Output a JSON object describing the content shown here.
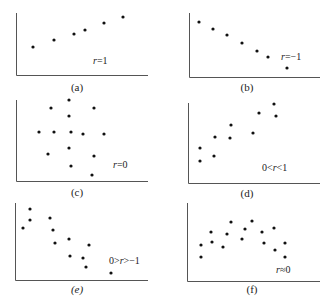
{
  "chart_data": [
    {
      "type": "scatter",
      "panel": "a",
      "caption": "(a)",
      "annotation": "r=1",
      "axes": {
        "origin": [
          16,
          75
        ],
        "x_end": 148,
        "y_top": 13
      },
      "points": [
        [
          33,
          47
        ],
        [
          54,
          40
        ],
        [
          74,
          34
        ],
        [
          85,
          30
        ],
        [
          104,
          23
        ],
        [
          123,
          17
        ]
      ],
      "label_pos": [
        93,
        64
      ],
      "caption_pos": [
        77,
        91
      ],
      "xlabel": "",
      "ylabel": "",
      "grid": false
    },
    {
      "type": "scatter",
      "panel": "b",
      "caption": "(b)",
      "annotation": "r=−1",
      "axes": {
        "origin": [
          189,
          77
        ],
        "x_end": 320,
        "y_top": 13
      },
      "points": [
        [
          199,
          22
        ],
        [
          213,
          29
        ],
        [
          227,
          35
        ],
        [
          242,
          43
        ],
        [
          257,
          51
        ],
        [
          268,
          57
        ],
        [
          287,
          68
        ]
      ],
      "label_pos": [
        281,
        60
      ],
      "caption_pos": [
        247,
        91
      ],
      "xlabel": "",
      "ylabel": "",
      "grid": false
    },
    {
      "type": "scatter",
      "panel": "c",
      "caption": "(c)",
      "annotation": "r=0",
      "axes": {
        "origin": [
          16,
          181
        ],
        "x_end": 148,
        "y_top": 100
      },
      "points": [
        [
          51,
          108
        ],
        [
          69,
          100
        ],
        [
          94,
          108
        ],
        [
          69,
          116
        ],
        [
          39,
          132
        ],
        [
          54,
          132
        ],
        [
          71,
          132
        ],
        [
          83,
          134
        ],
        [
          104,
          134
        ],
        [
          69,
          148
        ],
        [
          48,
          154
        ],
        [
          94,
          156
        ],
        [
          71,
          166
        ],
        [
          92,
          175
        ]
      ],
      "label_pos": [
        113,
        168
      ],
      "caption_pos": [
        77,
        196
      ],
      "xlabel": "",
      "ylabel": "",
      "grid": false
    },
    {
      "type": "scatter",
      "panel": "d",
      "caption": "(d)",
      "annotation": "0<r<1",
      "axes": {
        "origin": [
          188,
          183
        ],
        "x_end": 320,
        "y_top": 103
      },
      "points": [
        [
          200,
          148
        ],
        [
          200,
          161
        ],
        [
          215,
          137
        ],
        [
          214,
          156
        ],
        [
          230,
          138
        ],
        [
          231,
          125
        ],
        [
          253,
          133
        ],
        [
          259,
          113
        ],
        [
          274,
          104
        ],
        [
          276,
          116
        ]
      ],
      "label_pos": [
        262,
        171
      ],
      "caption_pos": [
        247,
        197
      ],
      "xlabel": "",
      "ylabel": "",
      "grid": false
    },
    {
      "type": "scatter",
      "panel": "e",
      "caption": "(e)",
      "annotation": "0>r>−1",
      "axes": {
        "origin": [
          15,
          280
        ],
        "x_end": 148,
        "y_top": 203
      },
      "points": [
        [
          30,
          209
        ],
        [
          30,
          220
        ],
        [
          23,
          228
        ],
        [
          50,
          218
        ],
        [
          53,
          230
        ],
        [
          55,
          243
        ],
        [
          69,
          239
        ],
        [
          70,
          256
        ],
        [
          89,
          245
        ],
        [
          83,
          258
        ],
        [
          86,
          267
        ],
        [
          111,
          273
        ]
      ],
      "label_pos": [
        109,
        264
      ],
      "caption_pos": [
        77,
        293
      ],
      "xlabel": "",
      "ylabel": "",
      "grid": false
    },
    {
      "type": "scatter",
      "panel": "f",
      "caption": "(f)",
      "annotation": "r≈0",
      "axes": {
        "origin": [
          187,
          281
        ],
        "x_end": 320,
        "y_top": 203
      },
      "points": [
        [
          201,
          245
        ],
        [
          201,
          257
        ],
        [
          211,
          232
        ],
        [
          212,
          242
        ],
        [
          223,
          247
        ],
        [
          227,
          234
        ],
        [
          231,
          222
        ],
        [
          242,
          239
        ],
        [
          245,
          229
        ],
        [
          252,
          221
        ],
        [
          262,
          232
        ],
        [
          264,
          243
        ],
        [
          274,
          228
        ],
        [
          275,
          250
        ],
        [
          285,
          243
        ],
        [
          285,
          257
        ]
      ],
      "label_pos": [
        276,
        273
      ],
      "caption_pos": [
        252,
        293
      ],
      "xlabel": "",
      "ylabel": "",
      "grid": false
    }
  ]
}
